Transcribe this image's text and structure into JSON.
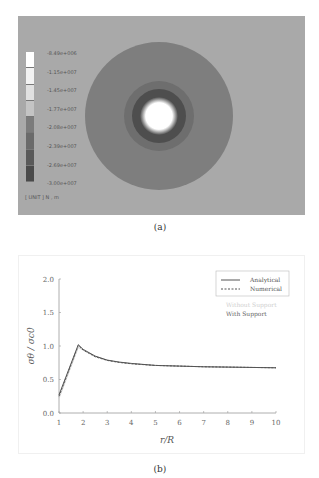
{
  "figure_a": {
    "caption": "(a)",
    "background_color": "#a9a9a9",
    "legend": {
      "labels": [
        "-8.49e+006",
        "-1.15e+007",
        "-1.45e+007",
        "-1.77e+007",
        "-2.08e+007",
        "-2.39e+007",
        "-2.69e+007",
        "-3.00e+007"
      ],
      "colors": [
        "#ffffff",
        "#f2f2f2",
        "#e0e0e0",
        "#c4c4c4",
        "#7b7b7b",
        "#6a6a6a",
        "#595959",
        "#4a4a4a"
      ],
      "unit": "[ UNIT ] N , m"
    },
    "contour": {
      "outer_disk_color": "#7e7e7e",
      "mid_ring_color": "#6e6e6e",
      "inner_ring_color": "#4e4e4e",
      "hole_color": "#ffffff"
    }
  },
  "figure_b": {
    "caption": "(b)",
    "legend": {
      "entries": [
        {
          "label": "Analytical",
          "style": "solid"
        },
        {
          "label": "Numerical",
          "style": "dashed"
        }
      ],
      "without_support": "Without Support",
      "with_support": "With Support"
    }
  },
  "chart_data": {
    "type": "line",
    "title": "",
    "xlabel": "r/R",
    "ylabel": "σθ / σc0",
    "xlim": [
      1,
      10
    ],
    "ylim": [
      0.0,
      2.0
    ],
    "x_ticks": [
      "1",
      "2",
      "3",
      "4",
      "5",
      "6",
      "7",
      "8",
      "9",
      "10"
    ],
    "y_ticks": [
      "0.0",
      "0.5",
      "1.0",
      "1.5",
      "2.0"
    ],
    "legend_position": "upper right",
    "grid": false,
    "x": [
      1.0,
      1.8,
      2.0,
      2.5,
      3.0,
      3.5,
      4.0,
      5.0,
      6.0,
      7.0,
      8.0,
      9.0,
      10.0
    ],
    "series": [
      {
        "name": "Analytical (With Support)",
        "style": "solid",
        "color": "#555555",
        "values": [
          0.27,
          1.02,
          0.95,
          0.85,
          0.79,
          0.76,
          0.74,
          0.71,
          0.7,
          0.69,
          0.685,
          0.68,
          0.675
        ]
      },
      {
        "name": "Numerical (With Support)",
        "style": "dashed",
        "color": "#555555",
        "values": [
          0.25,
          1.01,
          0.94,
          0.84,
          0.785,
          0.755,
          0.735,
          0.71,
          0.7,
          0.69,
          0.685,
          0.68,
          0.675
        ]
      },
      {
        "name": "Analytical (Without Support)",
        "style": "solid",
        "color": "#cccccc",
        "values": [
          0.22,
          0.98,
          0.94,
          0.84,
          0.785,
          0.755,
          0.735,
          0.71,
          0.7,
          0.69,
          0.685,
          0.68,
          0.675
        ]
      }
    ]
  }
}
